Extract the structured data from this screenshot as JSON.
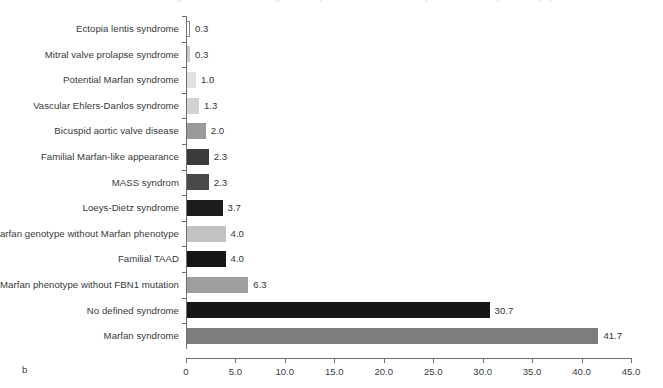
{
  "figure": {
    "panel_letter": "b",
    "title_remnant": "Figure distribution of diagnoses in patients referred for suspected Marfan syndrome (%)"
  },
  "chart_data": {
    "type": "bar",
    "orientation": "horizontal",
    "title": "",
    "xlabel": "",
    "ylabel": "",
    "xlim": [
      0,
      45
    ],
    "xticks": [
      0,
      5,
      10,
      15,
      20,
      25,
      30,
      35,
      40,
      45
    ],
    "xtick_labels": [
      "0",
      "5.0",
      "10.0",
      "15.0",
      "20.0",
      "25.0",
      "30.0",
      "35.0",
      "40.0",
      "45.0"
    ],
    "grid": false,
    "legend": "none",
    "categories": [
      "Ectopia lentis syndrome",
      "Mitral valve prolapse syndrome",
      "Potential Marfan syndrome",
      "Vascular Ehlers-Danlos syndrome",
      "Bicuspid aortic valve disease",
      "Familial Marfan-like appearance",
      "MASS syndrom",
      "Loeys-Dietz syndrome",
      "Marfan genotype without Marfan phenotype",
      "Familial TAAD",
      "Marfan phenotype without FBN1 mutation",
      "No defined syndrome",
      "Marfan syndrome"
    ],
    "values": [
      0.3,
      0.3,
      1.0,
      1.3,
      2.0,
      2.3,
      2.3,
      3.7,
      4.0,
      4.0,
      6.3,
      30.7,
      41.7
    ],
    "value_labels": [
      "0.3",
      "0.3",
      "1.0",
      "1.3",
      "2.0",
      "2.3",
      "2.3",
      "3.7",
      "4.0",
      "4.0",
      "6.3",
      "30.7",
      "41.7"
    ],
    "bar_colors": [
      "#ffffff",
      "#c9c9c9",
      "#e2e2e2",
      "#d3d3d3",
      "#9a9a9a",
      "#3b3b3b",
      "#4a4a4a",
      "#1c1c1c",
      "#c2c2c2",
      "#151515",
      "#9e9e9e",
      "#161616",
      "#7d7d7d"
    ],
    "bar_outlined": [
      true,
      false,
      false,
      false,
      false,
      false,
      false,
      false,
      false,
      false,
      false,
      false,
      false
    ]
  }
}
